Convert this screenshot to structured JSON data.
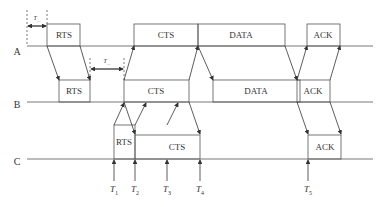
{
  "diagram": {
    "type": "timing-diagram",
    "nodes": [
      {
        "id": "A",
        "label": "A"
      },
      {
        "id": "B",
        "label": "B"
      },
      {
        "id": "C",
        "label": "C"
      }
    ],
    "frames": {
      "A": [
        {
          "label": "RTS"
        },
        {
          "label": "CTS"
        },
        {
          "label": "DATA"
        },
        {
          "label": "ACK"
        }
      ],
      "B": [
        {
          "label": "RTS"
        },
        {
          "label": "CTS"
        },
        {
          "label": "DATA"
        },
        {
          "label": "ACK"
        }
      ],
      "C": [
        {
          "label": "RTS"
        },
        {
          "label": "CTS"
        },
        {
          "label": "ACK"
        }
      ]
    },
    "interval_labels": [
      {
        "base": "T",
        "sub": "…"
      },
      {
        "base": "T",
        "sub": "…"
      }
    ],
    "time_markers": [
      {
        "base": "T",
        "sub": "1"
      },
      {
        "base": "T",
        "sub": "2"
      },
      {
        "base": "T",
        "sub": "3"
      },
      {
        "base": "T",
        "sub": "4"
      },
      {
        "base": "T",
        "sub": "5"
      }
    ]
  }
}
